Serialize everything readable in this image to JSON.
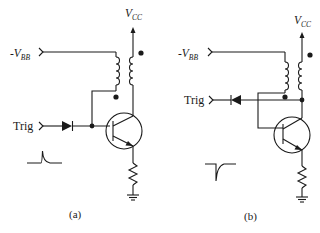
{
  "figure": {
    "panels": [
      {
        "id": "a",
        "caption": "(a)",
        "supply_label_main": "V",
        "supply_label_sub": "CC",
        "bias_label_prefix": "-V",
        "bias_label_sub": "BB",
        "trigger_label": "Trig",
        "trigger_pulse": "positive spike",
        "diode_direction": "toward base",
        "trigger_node": "base"
      },
      {
        "id": "b",
        "caption": "(b)",
        "supply_label_main": "V",
        "supply_label_sub": "CC",
        "bias_label_prefix": "-V",
        "bias_label_sub": "BB",
        "trigger_label": "Trig",
        "trigger_pulse": "negative spike",
        "diode_direction": "toward input",
        "trigger_node": "collector"
      }
    ]
  }
}
